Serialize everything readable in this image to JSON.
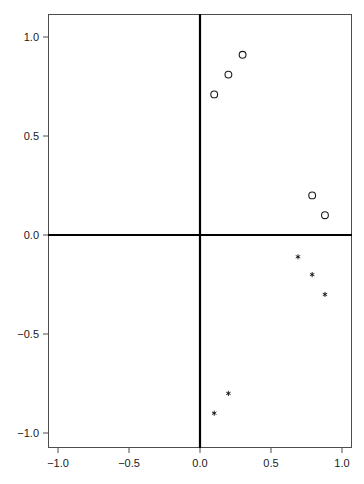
{
  "chart_data": {
    "type": "scatter",
    "title": "",
    "subtitle": "",
    "xlabel": "",
    "ylabel": "",
    "xlim": [
      -1.1,
      1.1
    ],
    "ylim": [
      -1.1,
      1.1
    ],
    "grid": false,
    "legend": null,
    "legend_position": "none",
    "xticks": [
      -1.0,
      -0.5,
      0.0,
      0.5,
      1.0
    ],
    "yticks": [
      -1.0,
      -0.5,
      0.0,
      0.5,
      1.0
    ],
    "xtick_labels": [
      "-1.0",
      "-0.5",
      "0.0",
      "0.5",
      "1.0"
    ],
    "ytick_labels": [
      "-1.0",
      "-0.5",
      "0.0",
      "0.5",
      "1.0"
    ],
    "reference_lines": [
      {
        "name": "horizontal-zero-line",
        "axis": "y",
        "value": 0.0
      },
      {
        "name": "vertical-zero-line",
        "axis": "x",
        "value": 0.0
      }
    ],
    "series": [
      {
        "name": "open-circles",
        "marker": "circle-open",
        "color": "#1a1a1a",
        "points": [
          {
            "x": 0.1,
            "y": 0.71
          },
          {
            "x": 0.2,
            "y": 0.81
          },
          {
            "x": 0.3,
            "y": 0.91
          },
          {
            "x": 0.79,
            "y": 0.2
          },
          {
            "x": 0.88,
            "y": 0.1
          }
        ]
      },
      {
        "name": "filled-stars",
        "marker": "star-filled",
        "color": "#1a1a1a",
        "points": [
          {
            "x": 0.69,
            "y": -0.11
          },
          {
            "x": 0.79,
            "y": -0.2
          },
          {
            "x": 0.88,
            "y": -0.3
          },
          {
            "x": 0.2,
            "y": -0.8
          },
          {
            "x": 0.1,
            "y": -0.9
          }
        ]
      }
    ]
  },
  "geometry": {
    "plot_left_px": 48,
    "plot_right_px": 352,
    "plot_top_px": 14,
    "plot_bottom_px": 448,
    "origin_x_px": 200,
    "origin_y_px": 235,
    "px_per_unit_x": 142,
    "px_per_unit_y": 198
  }
}
